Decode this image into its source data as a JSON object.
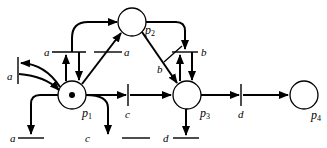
{
  "diagram": {
    "type": "petri-net",
    "places": [
      {
        "id": "p1",
        "label": "p",
        "sub": "1",
        "tokens": 1
      },
      {
        "id": "p2",
        "label": "p",
        "sub": "2",
        "tokens": 0
      },
      {
        "id": "p3",
        "label": "p",
        "sub": "3",
        "tokens": 0
      },
      {
        "id": "p4",
        "label": "p",
        "sub": "4",
        "tokens": 0
      }
    ],
    "transitions": {
      "a_top_left": "a",
      "a_top_right": "a",
      "a_left": "a",
      "a_bottom": "a",
      "b_cross": "b",
      "b_top": "b",
      "c_mid": "c",
      "c_bottom": "c",
      "d_mid": "d",
      "d_bottom": "d"
    }
  }
}
